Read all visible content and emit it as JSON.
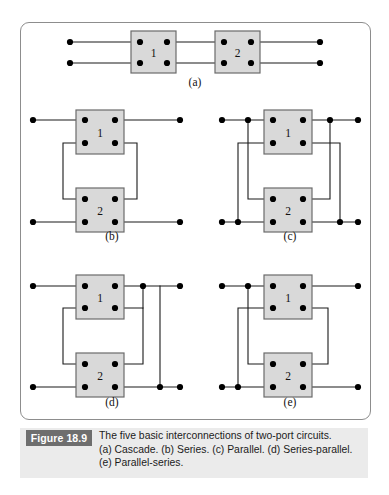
{
  "figure": {
    "badge": "Figure 18.9",
    "caption_lines": [
      "The five basic interconnections of two-port circuits.",
      "(a) Cascade. (b) Series. (c) Parallel. (d) Series-parallel.",
      "(e) Parallel-series."
    ],
    "panel_border_color": "#8d8d8d",
    "caption_band_color": "#ebebeb",
    "badge_color": "#6e6e6e",
    "box_fill": "#d9d9d9",
    "box_stroke": "#6b6b6b",
    "wire_color": "#1a1a1a",
    "node_color": "#000000"
  },
  "circuits": [
    {
      "id": "a",
      "name": "cascade",
      "sublabel": "(a)",
      "sublabel_pos": [
        195,
        86
      ],
      "boxes": [
        {
          "label": "1",
          "x": 131,
          "y": 31,
          "w": 45,
          "h": 42
        },
        {
          "label": "2",
          "x": 215,
          "y": 31,
          "w": 45,
          "h": 42
        }
      ],
      "wires": [
        [
          [
            70,
            42
          ],
          [
            131,
            42
          ]
        ],
        [
          [
            176,
            42
          ],
          [
            215,
            42
          ]
        ],
        [
          [
            260,
            42
          ],
          [
            320,
            42
          ]
        ],
        [
          [
            70,
            63
          ],
          [
            131,
            63
          ]
        ],
        [
          [
            176,
            63
          ],
          [
            215,
            63
          ]
        ],
        [
          [
            260,
            63
          ],
          [
            320,
            63
          ]
        ]
      ],
      "nodes": [
        [
          70,
          42
        ],
        [
          70,
          63
        ],
        [
          320,
          42
        ],
        [
          320,
          63
        ],
        [
          140,
          42
        ],
        [
          167,
          42
        ],
        [
          140,
          63
        ],
        [
          167,
          63
        ],
        [
          224,
          42
        ],
        [
          251,
          42
        ],
        [
          224,
          63
        ],
        [
          251,
          63
        ]
      ]
    },
    {
      "id": "b",
      "name": "series",
      "sublabel": "(b)",
      "sublabel_pos": [
        112,
        240
      ],
      "boxes": [
        {
          "label": "1",
          "x": 76,
          "y": 110,
          "w": 48,
          "h": 44
        },
        {
          "label": "2",
          "x": 76,
          "y": 188,
          "w": 48,
          "h": 44
        }
      ],
      "wires": [
        [
          [
            33,
            120
          ],
          [
            76,
            120
          ]
        ],
        [
          [
            124,
            120
          ],
          [
            180,
            120
          ]
        ],
        [
          [
            33,
            222
          ],
          [
            76,
            222
          ]
        ],
        [
          [
            124,
            222
          ],
          [
            180,
            222
          ]
        ],
        [
          [
            85,
            143
          ],
          [
            63,
            143
          ],
          [
            63,
            199
          ],
          [
            85,
            199
          ]
        ],
        [
          [
            115,
            143
          ],
          [
            137,
            143
          ],
          [
            137,
            199
          ],
          [
            115,
            199
          ]
        ]
      ],
      "nodes": [
        [
          33,
          120
        ],
        [
          180,
          120
        ],
        [
          33,
          222
        ],
        [
          180,
          222
        ],
        [
          85,
          120
        ],
        [
          115,
          120
        ],
        [
          85,
          143
        ],
        [
          115,
          143
        ],
        [
          85,
          199
        ],
        [
          115,
          199
        ],
        [
          85,
          222
        ],
        [
          115,
          222
        ]
      ]
    },
    {
      "id": "c",
      "name": "parallel",
      "sublabel": "(c)",
      "sublabel_pos": [
        290,
        240
      ],
      "boxes": [
        {
          "label": "1",
          "x": 264,
          "y": 110,
          "w": 48,
          "h": 44
        },
        {
          "label": "2",
          "x": 264,
          "y": 188,
          "w": 48,
          "h": 44
        }
      ],
      "wires": [
        [
          [
            222,
            120
          ],
          [
            264,
            120
          ]
        ],
        [
          [
            312,
            120
          ],
          [
            358,
            120
          ]
        ],
        [
          [
            222,
            222
          ],
          [
            264,
            222
          ]
        ],
        [
          [
            312,
            222
          ],
          [
            358,
            222
          ]
        ],
        [
          [
            248,
            120
          ],
          [
            248,
            199
          ],
          [
            273,
            199
          ]
        ],
        [
          [
            330,
            120
          ],
          [
            330,
            199
          ],
          [
            303,
            199
          ]
        ],
        [
          [
            238,
            222
          ],
          [
            238,
            143
          ],
          [
            273,
            143
          ]
        ],
        [
          [
            340,
            222
          ],
          [
            340,
            143
          ],
          [
            303,
            143
          ]
        ]
      ],
      "nodes": [
        [
          222,
          120
        ],
        [
          358,
          120
        ],
        [
          222,
          222
        ],
        [
          358,
          222
        ],
        [
          248,
          120
        ],
        [
          330,
          120
        ],
        [
          238,
          222
        ],
        [
          340,
          222
        ],
        [
          273,
          120
        ],
        [
          303,
          120
        ],
        [
          273,
          143
        ],
        [
          303,
          143
        ],
        [
          273,
          199
        ],
        [
          303,
          199
        ],
        [
          273,
          222
        ],
        [
          303,
          222
        ]
      ]
    },
    {
      "id": "d",
      "name": "series-parallel",
      "sublabel": "(d)",
      "sublabel_pos": [
        112,
        406
      ],
      "boxes": [
        {
          "label": "1",
          "x": 76,
          "y": 275,
          "w": 48,
          "h": 44
        },
        {
          "label": "2",
          "x": 76,
          "y": 353,
          "w": 48,
          "h": 44
        }
      ],
      "wires": [
        [
          [
            33,
            286
          ],
          [
            76,
            286
          ]
        ],
        [
          [
            124,
            286
          ],
          [
            180,
            286
          ]
        ],
        [
          [
            33,
            387
          ],
          [
            76,
            387
          ]
        ],
        [
          [
            124,
            387
          ],
          [
            180,
            387
          ]
        ],
        [
          [
            85,
            308
          ],
          [
            63,
            308
          ],
          [
            63,
            364
          ],
          [
            85,
            364
          ]
        ],
        [
          [
            115,
            308
          ],
          [
            143,
            308
          ],
          [
            143,
            364
          ],
          [
            115,
            364
          ]
        ],
        [
          [
            143,
            286
          ],
          [
            143,
            308
          ]
        ],
        [
          [
            160,
            286
          ],
          [
            160,
            387
          ]
        ]
      ],
      "nodes": [
        [
          33,
          286
        ],
        [
          180,
          286
        ],
        [
          33,
          387
        ],
        [
          180,
          387
        ],
        [
          143,
          286
        ],
        [
          160,
          387
        ],
        [
          85,
          286
        ],
        [
          115,
          286
        ],
        [
          85,
          308
        ],
        [
          115,
          308
        ],
        [
          85,
          364
        ],
        [
          115,
          364
        ],
        [
          85,
          387
        ],
        [
          115,
          387
        ]
      ]
    },
    {
      "id": "e",
      "name": "parallel-series",
      "sublabel": "(e)",
      "sublabel_pos": [
        290,
        406
      ],
      "boxes": [
        {
          "label": "1",
          "x": 264,
          "y": 275,
          "w": 48,
          "h": 44
        },
        {
          "label": "2",
          "x": 264,
          "y": 353,
          "w": 48,
          "h": 44
        }
      ],
      "wires": [
        [
          [
            222,
            286
          ],
          [
            264,
            286
          ]
        ],
        [
          [
            312,
            286
          ],
          [
            358,
            286
          ]
        ],
        [
          [
            222,
            387
          ],
          [
            264,
            387
          ]
        ],
        [
          [
            312,
            387
          ],
          [
            358,
            387
          ]
        ],
        [
          [
            248,
            286
          ],
          [
            248,
            364
          ],
          [
            273,
            364
          ]
        ],
        [
          [
            238,
            387
          ],
          [
            238,
            308
          ],
          [
            273,
            308
          ]
        ],
        [
          [
            303,
            308
          ],
          [
            328,
            308
          ],
          [
            328,
            364
          ],
          [
            303,
            364
          ]
        ]
      ],
      "nodes": [
        [
          222,
          286
        ],
        [
          358,
          286
        ],
        [
          222,
          387
        ],
        [
          358,
          387
        ],
        [
          248,
          286
        ],
        [
          238,
          387
        ],
        [
          273,
          286
        ],
        [
          303,
          286
        ],
        [
          273,
          308
        ],
        [
          303,
          308
        ],
        [
          273,
          364
        ],
        [
          303,
          364
        ],
        [
          273,
          387
        ],
        [
          303,
          387
        ]
      ]
    }
  ]
}
